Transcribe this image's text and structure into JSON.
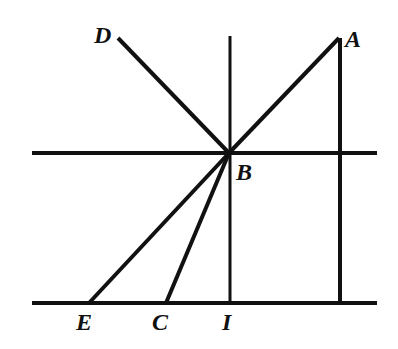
{
  "diagram": {
    "type": "geometry-ray-diagram",
    "labels": {
      "A": "A",
      "B": "B",
      "C": "C",
      "D": "D",
      "E": "E",
      "I": "I"
    },
    "points": {
      "A": [
        339,
        38
      ],
      "B": [
        229,
        153
      ],
      "C": [
        166,
        303
      ],
      "D": [
        118,
        38
      ],
      "E": [
        89,
        303
      ],
      "I": [
        230,
        303
      ]
    },
    "lines": [
      {
        "name": "upper-horizontal",
        "from": [
          32,
          153
        ],
        "to": [
          377,
          153
        ]
      },
      {
        "name": "lower-horizontal",
        "from": [
          32,
          303
        ],
        "to": [
          377,
          303
        ]
      },
      {
        "name": "normal-BI",
        "from": [
          230,
          36
        ],
        "to": [
          230,
          303
        ]
      },
      {
        "name": "vertical-A",
        "from": [
          340,
          38
        ],
        "to": [
          340,
          303
        ]
      },
      {
        "name": "ray-AB",
        "from": [
          339,
          38
        ],
        "to": [
          229,
          153
        ]
      },
      {
        "name": "ray-BD",
        "from": [
          229,
          153
        ],
        "to": [
          118,
          38
        ]
      },
      {
        "name": "ray-BE",
        "from": [
          229,
          153
        ],
        "to": [
          89,
          303
        ]
      },
      {
        "name": "ray-BC",
        "from": [
          229,
          153
        ],
        "to": [
          166,
          303
        ]
      }
    ],
    "stroke_color": "#111111"
  }
}
